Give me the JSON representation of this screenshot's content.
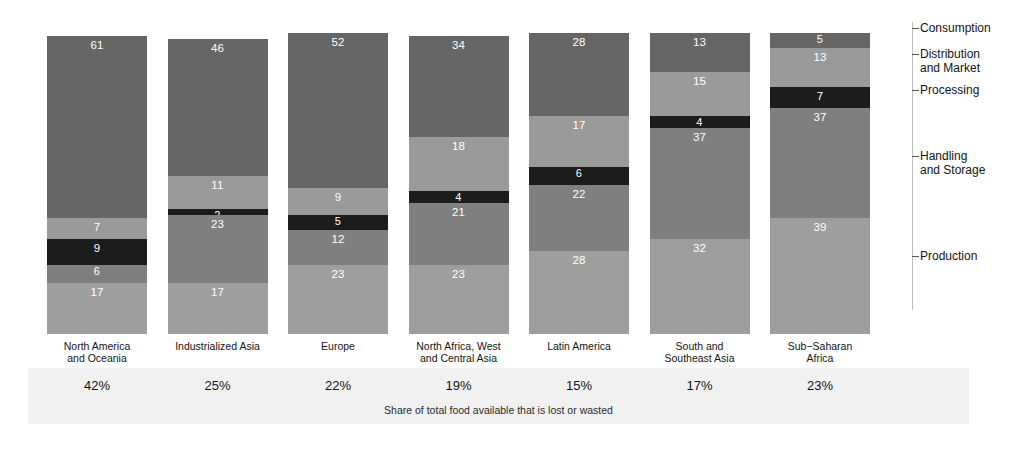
{
  "chart_data": {
    "type": "bar",
    "subtype": "stacked-bar",
    "title": "",
    "xlabel": "",
    "ylabel": "",
    "caption": "Share of total food available that is lost or wasted",
    "ylim": [
      0,
      101
    ],
    "grid": false,
    "legend_position": "right-axis",
    "categories": [
      "North America\nand Oceania",
      "Industrialized Asia",
      "Europe",
      "North Africa, West\nand Central Asia",
      "Latin America",
      "South and\nSoutheast Asia",
      "Sub−Saharan\nAfrica"
    ],
    "stage_order_bottom_to_top": [
      "Production",
      "Handling and Storage",
      "Processing",
      "Distribution and Market",
      "Consumption"
    ],
    "series": [
      {
        "name": "Production",
        "color": "#9e9e9e",
        "label_color": "#ffffff",
        "values": [
          17,
          17,
          23,
          23,
          28,
          32,
          39
        ]
      },
      {
        "name": "Handling and Storage",
        "color": "#7f7f7f",
        "label_color": "#ffffff",
        "values": [
          6,
          23,
          12,
          21,
          22,
          37,
          37
        ]
      },
      {
        "name": "Processing",
        "color": "#1c1c1c",
        "label_color": "#ffffff",
        "values": [
          9,
          2,
          5,
          4,
          6,
          4,
          7
        ]
      },
      {
        "name": "Distribution and Market",
        "color": "#9a9a9a",
        "label_color": "#ffffff",
        "values": [
          7,
          11,
          9,
          18,
          17,
          15,
          13
        ]
      },
      {
        "name": "Consumption",
        "color": "#666666",
        "label_color": "#ffffff",
        "values": [
          61,
          46,
          52,
          34,
          28,
          13,
          5
        ]
      }
    ],
    "share_lost_or_wasted": [
      "42%",
      "25%",
      "22%",
      "19%",
      "15%",
      "17%",
      "23%"
    ]
  },
  "legend": {
    "items": [
      {
        "label": "Consumption",
        "top": 22
      },
      {
        "label": "Distribution\nand Market",
        "top": 48
      },
      {
        "label": "Processing",
        "top": 84
      },
      {
        "label": "Handling\nand Storage",
        "top": 150
      },
      {
        "label": "Production",
        "top": 250
      }
    ]
  }
}
